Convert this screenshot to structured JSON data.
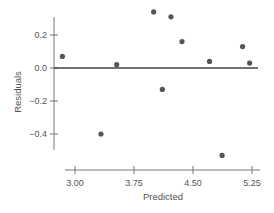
{
  "chart_data": {
    "type": "scatter",
    "title": "",
    "xlabel": "Predicted",
    "ylabel": "Residuals",
    "xlim": [
      2.85,
      5.3
    ],
    "ylim": [
      -0.55,
      0.35
    ],
    "x_ticks": [
      3.0,
      3.75,
      4.5,
      5.25
    ],
    "x_tick_labels": [
      "3.00",
      "3.75",
      "4.50",
      "5.25"
    ],
    "y_ticks": [
      0.2,
      0.0,
      -0.2,
      -0.4
    ],
    "y_tick_labels": [
      "0.2",
      "0.0",
      "−0.2",
      "−0.4"
    ],
    "grid": false,
    "reference_line": {
      "y": 0.0
    },
    "series": [
      {
        "name": "Residuals",
        "points": [
          {
            "x": 2.84,
            "y": 0.07
          },
          {
            "x": 3.53,
            "y": 0.02
          },
          {
            "x": 3.33,
            "y": -0.4
          },
          {
            "x": 4.0,
            "y": 0.34
          },
          {
            "x": 4.22,
            "y": 0.31
          },
          {
            "x": 4.11,
            "y": -0.13
          },
          {
            "x": 4.36,
            "y": 0.16
          },
          {
            "x": 4.71,
            "y": 0.04
          },
          {
            "x": 4.87,
            "y": -0.53
          },
          {
            "x": 5.13,
            "y": 0.13
          },
          {
            "x": 5.22,
            "y": 0.03
          }
        ]
      }
    ],
    "colors": {
      "points": "#555555",
      "axes": "#777777",
      "zero_line": "#444444"
    }
  }
}
